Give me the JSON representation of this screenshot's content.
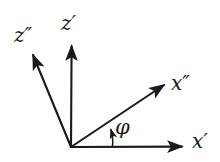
{
  "figure": {
    "kind": "coordinate-axes-rotation-diagram",
    "background_color": "#fefefe",
    "stroke_color": "#1a1a1a",
    "origin": {
      "x": 71,
      "y": 147
    },
    "axes": [
      {
        "id": "z-double-prime",
        "label": "z",
        "primes": "″",
        "label_text": "z″",
        "tip": {
          "x": 31,
          "y": 52
        },
        "label_pos": {
          "x": 14,
          "y": 25
        }
      },
      {
        "id": "z-prime",
        "label": "z",
        "primes": "′",
        "label_text": "z′",
        "tip": {
          "x": 72,
          "y": 42
        },
        "label_pos": {
          "x": 61,
          "y": 13
        }
      },
      {
        "id": "x-double-prime",
        "label": "x",
        "primes": "″",
        "label_text": "x″",
        "tip": {
          "x": 168,
          "y": 82
        },
        "label_pos": {
          "x": 171,
          "y": 73
        }
      },
      {
        "id": "x-prime",
        "label": "x",
        "primes": "′",
        "label_text": "x′",
        "tip": {
          "x": 188,
          "y": 146
        },
        "label_pos": {
          "x": 192,
          "y": 131
        }
      }
    ],
    "angle_marker": {
      "id": "phi-angle",
      "symbol": "φ",
      "label_pos": {
        "x": 115,
        "y": 117
      },
      "between": [
        "x-prime",
        "x-double-prime"
      ],
      "arc_radius": 42,
      "arc_start_deg": 0,
      "arc_end_deg": 30
    }
  }
}
